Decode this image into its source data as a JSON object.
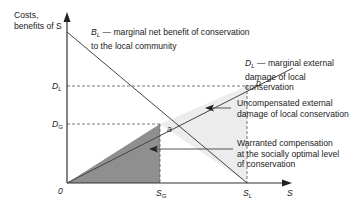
{
  "y_axis_label": [
    "Costs,",
    "benefits of S"
  ],
  "x_axis_label": "S",
  "origin_label": "0",
  "tick_labels": {
    "y": [
      {
        "main": "D",
        "sub": "L"
      },
      {
        "main": "D",
        "sub": "G"
      }
    ],
    "x": [
      {
        "main": "S",
        "sub": "G"
      },
      {
        "main": "S",
        "sub": "L"
      }
    ]
  },
  "points": {
    "a": "a",
    "b": "b"
  },
  "curves": {
    "benefit": {
      "symbol": "B",
      "sub": "L",
      "text1": " — marginal net benefit of conservation",
      "text2": "to the local community"
    },
    "damage": {
      "symbol": "D",
      "sub": "L",
      "text1": " — marginal external",
      "text2": "damage of local",
      "text3": "conservation"
    }
  },
  "annotations": {
    "uncompensated": [
      "Uncompensated external",
      "damage of local conservation"
    ],
    "warranted": [
      "Warranted compensation",
      "at the socially optimal level",
      "of conservation"
    ]
  },
  "colors": {
    "axis": "#333333",
    "line": "#444444",
    "dark_fill": "#8f8f8f",
    "light_fill": "#ececec",
    "dash": "#555555"
  }
}
